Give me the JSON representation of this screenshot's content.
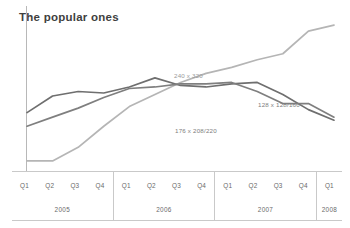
{
  "title": "The popular ones",
  "colors": {
    "axis": "#b8b8b8",
    "grid": "#c9c9c9",
    "series_light": "#b5b5b5",
    "series_dark": "#6f6f6f",
    "series_mid": "#7f7f7f",
    "title_text": "#3f3f3f",
    "label_text": "#6a6a6a"
  },
  "axis": {
    "years": [
      {
        "year": "2005",
        "quarters": [
          "Q1",
          "Q2",
          "Q3",
          "Q4"
        ]
      },
      {
        "year": "2006",
        "quarters": [
          "Q1",
          "Q2",
          "Q3",
          "Q4"
        ]
      },
      {
        "year": "2007",
        "quarters": [
          "Q1",
          "Q2",
          "Q3",
          "Q4"
        ]
      },
      {
        "year": "2008",
        "quarters": [
          "Q1"
        ]
      }
    ]
  },
  "annotations": {
    "label_240x320": "240 x 320",
    "label_128x128160": "128 x 128/160",
    "label_176x208220": "176 x 208/220"
  },
  "chart_data": {
    "type": "line",
    "title": "The popular ones",
    "xlabel": "",
    "ylabel": "",
    "grid": false,
    "legend_position": "inline-annotations",
    "x": [
      "2005 Q1",
      "2005 Q2",
      "2005 Q3",
      "2005 Q4",
      "2006 Q1",
      "2006 Q2",
      "2006 Q3",
      "2006 Q4",
      "2007 Q1",
      "2007 Q2",
      "2007 Q3",
      "2007 Q4",
      "2008 Q1"
    ],
    "ylim": [
      0,
      100
    ],
    "series": [
      {
        "name": "240 x 320",
        "color": "#b5b5b5",
        "values": [
          4,
          4,
          13,
          27,
          40,
          48,
          56,
          62,
          66,
          71,
          75,
          90,
          94
        ]
      },
      {
        "name": "176 x 208/220",
        "color": "#6f6f6f",
        "values": [
          36,
          47,
          50,
          49,
          53,
          59,
          54,
          53,
          55,
          56,
          48,
          38,
          31
        ]
      },
      {
        "name": "128 x 128/160",
        "color": "#7f7f7f",
        "values": [
          27,
          33,
          39,
          46,
          52,
          53,
          55,
          55,
          56,
          50,
          42,
          42,
          33
        ]
      }
    ]
  }
}
